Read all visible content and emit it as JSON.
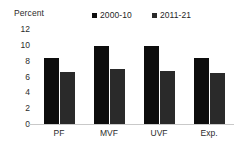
{
  "chart_data": {
    "type": "bar",
    "title": "",
    "ylabel": "Percent",
    "xlabel": "",
    "categories": [
      "PF",
      "MVF",
      "UVF",
      "Exp."
    ],
    "series": [
      {
        "name": "2000-10",
        "color": "#0d0d0d",
        "values": [
          8.3,
          9.9,
          9.8,
          8.4
        ]
      },
      {
        "name": "2011-21",
        "color": "#2a2a2a",
        "values": [
          6.6,
          6.9,
          6.7,
          6.4
        ]
      }
    ],
    "ylim": [
      0,
      12
    ],
    "yticks": [
      12,
      10,
      8,
      6,
      4,
      2,
      0
    ],
    "grid": false,
    "legend_position": "top",
    "legend_marker": "square"
  }
}
